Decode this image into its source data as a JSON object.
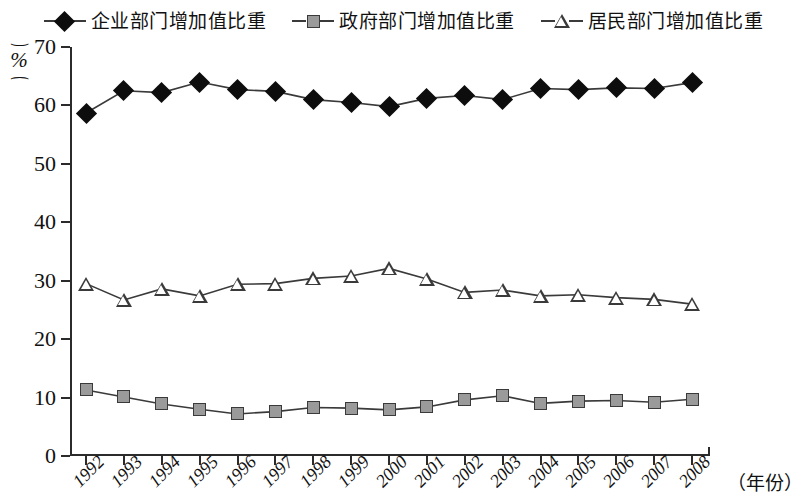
{
  "legend": {
    "items": [
      {
        "label": "企业部门增加值比重",
        "marker": "diamond-marker",
        "color": "#0d0d0d"
      },
      {
        "label": "政府部门增加值比重",
        "marker": "square-marker",
        "color": "#9a9a9a"
      },
      {
        "label": "居民部门增加值比重",
        "marker": "triangle-marker",
        "color": "#ffffff"
      }
    ]
  },
  "axes": {
    "y_unit_label": "%",
    "y_ticks": [
      "0",
      "10",
      "20",
      "30",
      "40",
      "50",
      "60",
      "70"
    ],
    "x_axis_title": "（年份）"
  },
  "chart_data": {
    "type": "line",
    "title": "",
    "subtitle": "",
    "xlabel": "（年份）",
    "ylabel": "%",
    "ylim": [
      0,
      70
    ],
    "xlim": [
      1992,
      2008
    ],
    "ytick_step": 10,
    "grid": false,
    "legend_position": "top-center",
    "x": [
      1992,
      1993,
      1994,
      1995,
      1996,
      1997,
      1998,
      1999,
      2000,
      2001,
      2002,
      2003,
      2004,
      2005,
      2006,
      2007,
      2008
    ],
    "categories": [
      "1992",
      "1993",
      "1994",
      "1995",
      "1996",
      "1997",
      "1998",
      "1999",
      "2000",
      "2001",
      "2002",
      "2003",
      "2004",
      "2005",
      "2006",
      "2007",
      "2008"
    ],
    "series": [
      {
        "name": "企业部门增加值比重",
        "marker": "diamond",
        "color": "#0d0d0d",
        "values": [
          58.7,
          62.5,
          62.2,
          64.0,
          62.7,
          62.4,
          61.0,
          60.5,
          59.8,
          61.2,
          61.7,
          61.0,
          62.9,
          62.7,
          63.0,
          62.9,
          63.9
        ]
      },
      {
        "name": "政府部门增加值比重",
        "marker": "square",
        "color": "#9a9a9a",
        "values": [
          11.3,
          10.1,
          8.9,
          8.0,
          7.2,
          7.6,
          8.3,
          8.2,
          7.9,
          8.4,
          9.6,
          10.3,
          9.0,
          9.4,
          9.5,
          9.2,
          9.7
        ]
      },
      {
        "name": "居民部门增加值比重",
        "marker": "triangle",
        "color": "#ffffff",
        "values": [
          29.5,
          26.7,
          28.6,
          27.4,
          29.4,
          29.5,
          30.4,
          30.8,
          32.1,
          30.3,
          28.0,
          28.4,
          27.4,
          27.6,
          27.1,
          26.8,
          26.0
        ]
      }
    ]
  }
}
